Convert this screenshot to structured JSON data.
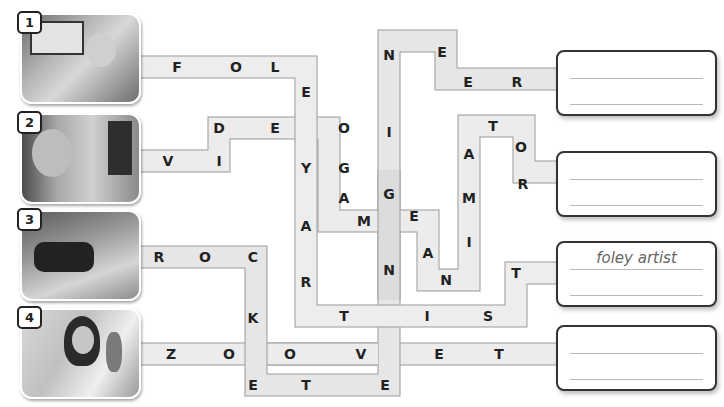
{
  "puzzle": {
    "type": "word-path maze",
    "items": [
      {
        "number": "1",
        "photo": "man with headphones at sound mixing desk",
        "path_letters": [
          "F",
          "O",
          "L",
          "E",
          "Y",
          "A",
          "R",
          "T",
          "I",
          "S",
          "T"
        ],
        "answer": "foley artist",
        "answer_shown": true
      },
      {
        "number": "2",
        "photo": "man with glasses at computer with animation",
        "path_letters": [
          "V",
          "I",
          "D",
          "E",
          "O",
          "G",
          "A",
          "M",
          "E",
          "A",
          "N",
          "I",
          "M",
          "A",
          "T",
          "O",
          "R"
        ],
        "answer": "",
        "answer_shown": false
      },
      {
        "number": "3",
        "photo": "woman writing at lab bench",
        "path_letters": [
          "R",
          "O",
          "C",
          "K",
          "E",
          "T",
          "E",
          "N",
          "G",
          "I",
          "N",
          "E",
          "E",
          "R"
        ],
        "answer": "",
        "answer_shown": false
      },
      {
        "number": "4",
        "photo": "woman in white coat with parrot on shoulder",
        "path_letters": [
          "Z",
          "O",
          "O",
          "V",
          "E",
          "T"
        ],
        "answer": "",
        "answer_shown": false
      }
    ]
  },
  "letters": [
    {
      "ch": "F"
    },
    {
      "ch": "O"
    },
    {
      "ch": "L"
    },
    {
      "ch": "E"
    },
    {
      "ch": "Y"
    },
    {
      "ch": "A"
    },
    {
      "ch": "R"
    },
    {
      "ch": "T"
    },
    {
      "ch": "I"
    },
    {
      "ch": "S"
    },
    {
      "ch": "T"
    },
    {
      "ch": "V"
    },
    {
      "ch": "I"
    },
    {
      "ch": "D"
    },
    {
      "ch": "E"
    },
    {
      "ch": "O"
    },
    {
      "ch": "G"
    },
    {
      "ch": "A"
    },
    {
      "ch": "M"
    },
    {
      "ch": "E"
    },
    {
      "ch": "A"
    },
    {
      "ch": "N"
    },
    {
      "ch": "I"
    },
    {
      "ch": "M"
    },
    {
      "ch": "A"
    },
    {
      "ch": "T"
    },
    {
      "ch": "O"
    },
    {
      "ch": "R"
    },
    {
      "ch": "R"
    },
    {
      "ch": "O"
    },
    {
      "ch": "C"
    },
    {
      "ch": "K"
    },
    {
      "ch": "E"
    },
    {
      "ch": "T"
    },
    {
      "ch": "E"
    },
    {
      "ch": "N"
    },
    {
      "ch": "G"
    },
    {
      "ch": "I"
    },
    {
      "ch": "N"
    },
    {
      "ch": "E"
    },
    {
      "ch": "E"
    },
    {
      "ch": "R"
    },
    {
      "ch": "Z"
    },
    {
      "ch": "O"
    },
    {
      "ch": "O"
    },
    {
      "ch": "V"
    },
    {
      "ch": "E"
    },
    {
      "ch": "T"
    }
  ],
  "colors": {
    "path_fill": "#ebebeb",
    "path_border": "#9a9a9a",
    "dark_path_fill": "#dcdcdc"
  }
}
